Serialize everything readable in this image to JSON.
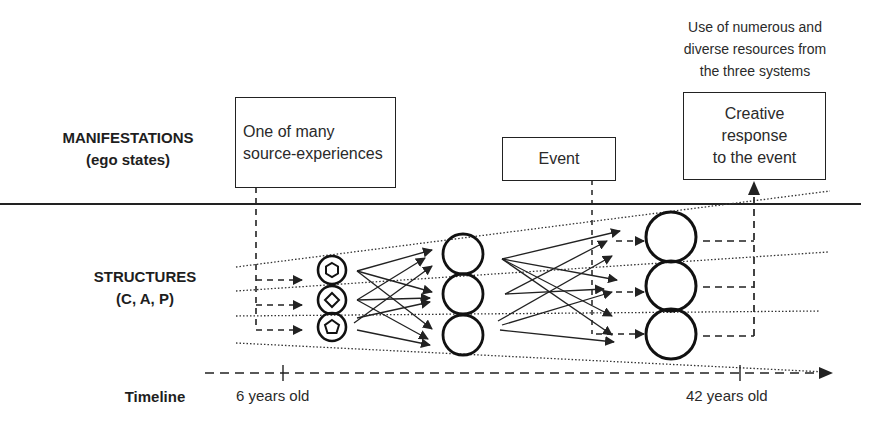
{
  "rows": {
    "manifestations": {
      "title": "MANIFESTATIONS",
      "subtitle": "(ego states)"
    },
    "structures": {
      "title": "STRUCTURES",
      "subtitle": "(C, A, P)"
    },
    "timeline": {
      "title": "Timeline"
    }
  },
  "boxes": {
    "source": {
      "lines": [
        "One of many",
        "source-experiences"
      ]
    },
    "event": {
      "lines": [
        "Event"
      ]
    },
    "response": {
      "lines": [
        "Creative",
        "response",
        "to the event"
      ]
    }
  },
  "annotation": {
    "lines": [
      "Use of numerous and",
      "diverse resources from",
      "the three systems"
    ]
  },
  "timeline": {
    "ticks": [
      {
        "label": "6 years old",
        "x": 283
      },
      {
        "label": "42 years old",
        "x": 740
      }
    ]
  },
  "structure_groups": [
    {
      "name": "childhood-structures",
      "cx": 332,
      "cy": [
        270,
        300,
        327
      ],
      "r": 14,
      "inner_shapes": [
        "hexagon",
        "diamond",
        "pentagon"
      ]
    },
    {
      "name": "intermediate-structures",
      "cx": 463,
      "cy": [
        254,
        294,
        335
      ],
      "r": 20
    },
    {
      "name": "adult-structures",
      "cx": 671,
      "cy": [
        237,
        286,
        334
      ],
      "r": 25
    }
  ],
  "colors": {
    "ink": "#222222",
    "background": "#ffffff"
  }
}
